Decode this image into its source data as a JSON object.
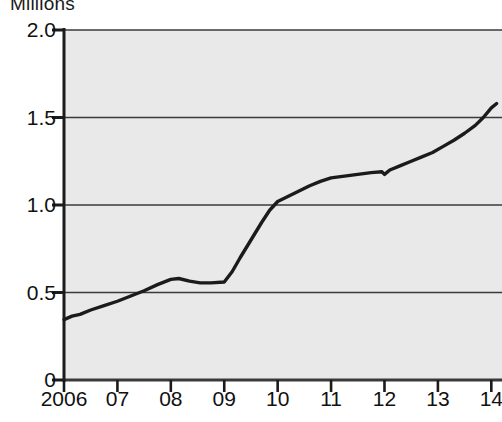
{
  "chart_data": {
    "type": "line",
    "title": "Millions",
    "xlabel": "",
    "ylabel": "Millions",
    "ylim": [
      0,
      2.0
    ],
    "xlim": [
      2006,
      2014.2
    ],
    "grid": true,
    "legend": null,
    "y_ticks": [
      "2.0",
      "1.5",
      "1.0",
      "0.5",
      "0"
    ],
    "y_tick_values": [
      2.0,
      1.5,
      1.0,
      0.5,
      0
    ],
    "x_ticks": [
      "2006",
      "07",
      "08",
      "09",
      "10",
      "11",
      "12",
      "13",
      "14"
    ],
    "x_tick_values": [
      2006,
      2007,
      2008,
      2009,
      2010,
      2011,
      2012,
      2013,
      2014
    ],
    "plot_bg_color": "#e9e9e9",
    "line_color": "#1b1b1b",
    "series": [
      {
        "name": "Millions",
        "x": [
          2006.0,
          2006.15,
          2006.3,
          2006.5,
          2006.75,
          2007.0,
          2007.25,
          2007.5,
          2007.75,
          2008.0,
          2008.15,
          2008.35,
          2008.55,
          2008.75,
          2009.0,
          2009.15,
          2009.3,
          2009.5,
          2009.7,
          2009.85,
          2010.0,
          2010.2,
          2010.4,
          2010.6,
          2010.8,
          2011.0,
          2011.25,
          2011.5,
          2011.75,
          2011.95,
          2012.0,
          2012.1,
          2012.3,
          2012.5,
          2012.7,
          2012.9,
          2013.1,
          2013.3,
          2013.5,
          2013.7,
          2013.85,
          2014.0,
          2014.1
        ],
        "y": [
          0.345,
          0.365,
          0.375,
          0.4,
          0.425,
          0.45,
          0.48,
          0.51,
          0.545,
          0.575,
          0.58,
          0.565,
          0.555,
          0.555,
          0.56,
          0.62,
          0.7,
          0.8,
          0.9,
          0.97,
          1.02,
          1.05,
          1.08,
          1.11,
          1.135,
          1.155,
          1.165,
          1.175,
          1.185,
          1.19,
          1.175,
          1.2,
          1.225,
          1.25,
          1.275,
          1.3,
          1.335,
          1.37,
          1.41,
          1.455,
          1.5,
          1.555,
          1.58
        ]
      }
    ]
  }
}
